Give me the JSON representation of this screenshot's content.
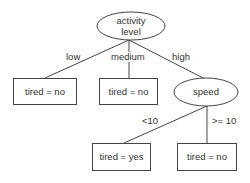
{
  "diagram": {
    "type": "decision-tree",
    "colors": {
      "stroke": "#444444",
      "text": "#333333",
      "background": "#ffffff"
    },
    "root": {
      "line1": "activity",
      "line2": "level"
    },
    "edges": {
      "low": "low",
      "medium": "medium",
      "high": "high",
      "lt10": "<10",
      "ge10": ">= 10"
    },
    "nodes": {
      "leaf_low": "tired = no",
      "leaf_medium": "tired = no",
      "speed": "speed",
      "leaf_speed_lt10": "tired = yes",
      "leaf_speed_ge10": "tired = no"
    }
  }
}
